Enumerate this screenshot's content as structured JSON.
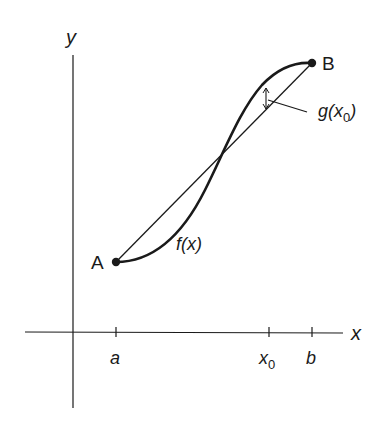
{
  "diagram": {
    "axes": {
      "x_label": "x",
      "y_label": "y"
    },
    "ticks": [
      {
        "label": "a",
        "sub": ""
      },
      {
        "label": "x",
        "sub": "0"
      },
      {
        "label": "b",
        "sub": ""
      }
    ],
    "points": {
      "A": "A",
      "B": "B"
    },
    "curve_label": "f(x)",
    "gap_label": {
      "prefix": "g(x",
      "sub": "0",
      "suffix": ")"
    },
    "colors": {
      "stroke": "#1a1a1a",
      "background": "#ffffff"
    }
  }
}
